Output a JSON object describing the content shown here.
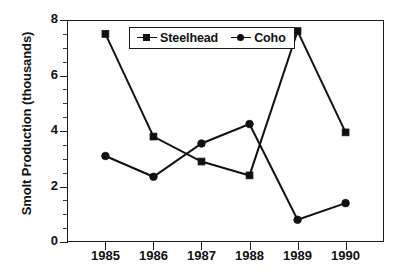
{
  "chart_data": {
    "type": "line",
    "title": "",
    "xlabel": "",
    "ylabel": "Smolt Production (thousands)",
    "categories": [
      "1985",
      "1986",
      "1987",
      "1988",
      "1989",
      "1990"
    ],
    "x": [
      1985,
      1986,
      1987,
      1988,
      1989,
      1990
    ],
    "series": [
      {
        "name": "Steelhead",
        "marker": "square",
        "values": [
          7.5,
          3.8,
          2.9,
          2.4,
          7.6,
          3.95
        ]
      },
      {
        "name": "Coho",
        "marker": "circle",
        "values": [
          3.1,
          2.35,
          3.55,
          4.25,
          0.8,
          1.4
        ]
      }
    ],
    "ylim": [
      0,
      8
    ],
    "y_major_ticks": [
      0,
      2,
      4,
      6,
      8
    ],
    "y_minor_tick_step": 0.5,
    "y_tick_labels": [
      "0",
      "2",
      "4",
      "6",
      "8"
    ],
    "x_tick_labels": [
      "1985",
      "1986",
      "1987",
      "1988",
      "1989",
      "1990"
    ],
    "grid": false,
    "legend_position": "top-center-inside",
    "legend_entries": [
      "Steelhead",
      "Coho"
    ],
    "line_color": "#111111",
    "marker_color": "#111111",
    "background_color": "#ffffff"
  }
}
